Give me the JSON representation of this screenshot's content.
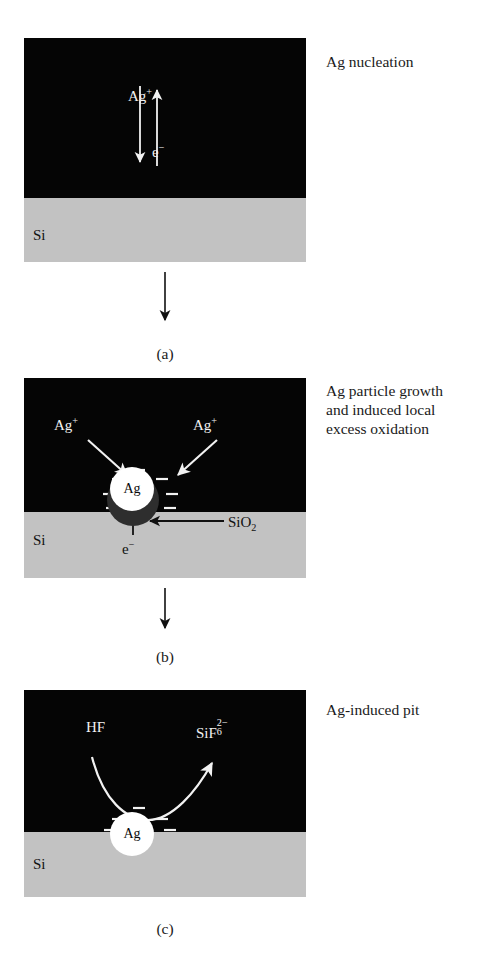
{
  "figure": {
    "title_note": "Silver-assisted electroless etching of silicon — three stage schematic",
    "colors": {
      "solution": "#050505",
      "substrate": "#c2c2c2",
      "oxide": "#2e2e2e",
      "particle": "#ffffff",
      "label_dark": "#1a1a1a",
      "label_light": "#f2f2f2"
    }
  },
  "panels": [
    {
      "id": "a",
      "caption": "(a)",
      "side_caption_lines": [
        "Ag nucleation"
      ],
      "substrate_label": "Si",
      "species": [
        {
          "name": "silver-ion-label",
          "text_base": "Ag",
          "text_sup": "+"
        },
        {
          "name": "electron-label",
          "text_base": "e",
          "text_sup": "−"
        }
      ],
      "arrows": [
        {
          "name": "ag-ion-down-arrow",
          "direction": "down"
        },
        {
          "name": "electron-up-arrow",
          "direction": "up"
        }
      ]
    },
    {
      "id": "b",
      "caption": "(b)",
      "side_caption_lines": [
        "Ag particle growth",
        "and induced local",
        "excess oxidation"
      ],
      "substrate_label": "Si",
      "particle_label": "Ag",
      "species": [
        {
          "name": "silver-ion-label-left",
          "text_base": "Ag",
          "text_sup": "+"
        },
        {
          "name": "silver-ion-label-right",
          "text_base": "Ag",
          "text_sup": "+"
        },
        {
          "name": "electron-label",
          "text_base": "e",
          "text_sup": "−"
        },
        {
          "name": "silicon-dioxide-label",
          "text_base": "SiO",
          "text_sub": "2"
        }
      ],
      "arrows": [
        {
          "name": "ag-ion-arrow-left",
          "direction": "diagonal-down-right"
        },
        {
          "name": "ag-ion-arrow-right",
          "direction": "diagonal-down-left"
        },
        {
          "name": "electron-up-arrow",
          "direction": "up"
        },
        {
          "name": "oxide-pointer-arrow",
          "direction": "left"
        }
      ]
    },
    {
      "id": "c",
      "caption": "(c)",
      "side_caption_lines": [
        "Ag-induced pit"
      ],
      "substrate_label": "Si",
      "particle_label": "Ag",
      "species": [
        {
          "name": "hydrofluoric-acid-label",
          "text_base": "HF"
        },
        {
          "name": "hexafluorosilicate-label",
          "text_base": "SiF",
          "text_sup": "2−",
          "text_sub": "6"
        }
      ],
      "arrows": [
        {
          "name": "reaction-curve-arrow",
          "direction": "curved-up-right"
        }
      ]
    }
  ],
  "flow_arrows": [
    {
      "name": "flow-arrow-a-to-b",
      "direction": "down"
    },
    {
      "name": "flow-arrow-b-to-c",
      "direction": "down"
    }
  ]
}
